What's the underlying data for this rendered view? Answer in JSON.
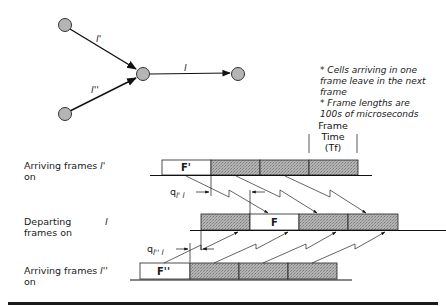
{
  "graph": {
    "edges": [
      {
        "label": "l'",
        "from": "top-left",
        "to": "center"
      },
      {
        "label": "l''",
        "from": "bottom-left",
        "to": "center"
      },
      {
        "label": "l",
        "from": "center",
        "to": "right"
      }
    ]
  },
  "notes": [
    "* Cells arriving in one frame leave in the next frame",
    "* Frame lengths are 100s of microseconds"
  ],
  "notes_lines": {
    "n1a": "* Cells arriving in one",
    "n1b": "frame leave in the next",
    "n1c": "frame",
    "n2a": "* Frame lengths are",
    "n2b": "100s of microseconds"
  },
  "frame_time": {
    "line1": "Frame",
    "line2": "Time",
    "line3": "(Tf)"
  },
  "rows": {
    "arriving_top": {
      "label_line1": "Arriving frames",
      "label_line2": "on",
      "link": "l'",
      "first_frame": "F'"
    },
    "departing": {
      "label_line1": "Departing",
      "label_line2": "frames on",
      "link": "l",
      "marked_frame": "F"
    },
    "arriving_bottom": {
      "label_line1": "Arriving frames",
      "label_line2": "on",
      "link": "l''",
      "first_frame": "F''"
    }
  },
  "delays": {
    "q_top": {
      "q": "q",
      "sub": "l' l"
    },
    "q_bottom": {
      "q": "q",
      "sub": "l'' l"
    }
  },
  "colors": {
    "node_fill": "#b5b5b5",
    "frame_shaded": "#a8a8a8",
    "line": "#111111"
  }
}
